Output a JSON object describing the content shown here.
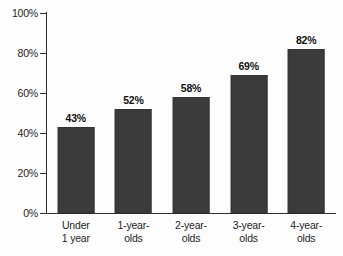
{
  "chart_data": {
    "type": "bar",
    "title": "",
    "subtitle": "",
    "xlabel": "",
    "ylabel": "",
    "categories": [
      "Under 1 year",
      "1-year-olds",
      "2-year-olds",
      "3-year-olds",
      "4-year-olds"
    ],
    "category_lines": [
      [
        "Under",
        "1 year"
      ],
      [
        "1-year-",
        "olds"
      ],
      [
        "2-year-",
        "olds"
      ],
      [
        "3-year-",
        "olds"
      ],
      [
        "4-year-",
        "olds"
      ]
    ],
    "values": [
      43,
      52,
      58,
      69,
      82
    ],
    "value_labels": [
      "43%",
      "52%",
      "58%",
      "69%",
      "82%"
    ],
    "ylim": [
      0,
      100
    ],
    "ytick_values": [
      0,
      20,
      40,
      60,
      80,
      100
    ],
    "ytick_labels": [
      "0%",
      "20%",
      "40%",
      "60%",
      "80%",
      "100%"
    ],
    "grid": false,
    "legend": null,
    "bar_color": "#3b3b3b",
    "axis_color": "#2e2e2e",
    "background_color": "#fdfdfd",
    "text_color": "#1d1d1d"
  }
}
